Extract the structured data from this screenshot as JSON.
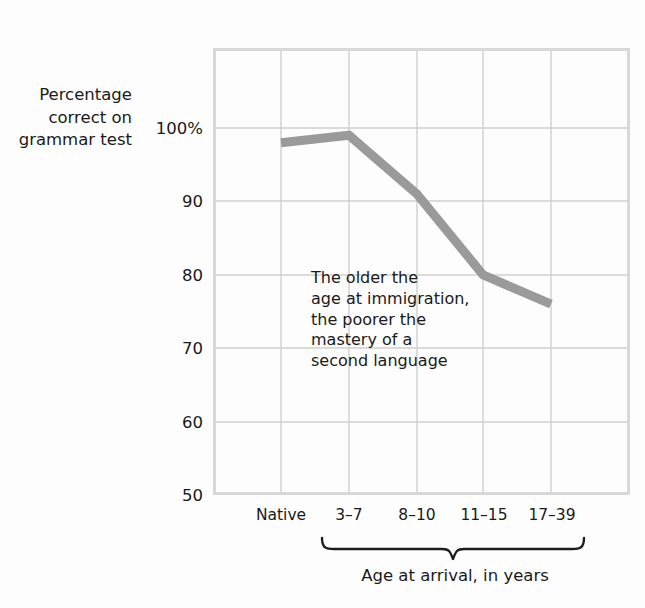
{
  "chart_data": {
    "type": "line",
    "title": "",
    "ylabel": "Percentage\ncorrect on\ngrammar test",
    "xlabel": "Age at arrival, in years",
    "categories": [
      "Native",
      "3–7",
      "8–10",
      "11–15",
      "17–39"
    ],
    "values": [
      98,
      99,
      91,
      80,
      76
    ],
    "series": [
      {
        "name": "Percentage correct on grammar test",
        "values": [
          98,
          99,
          91,
          80,
          76
        ],
        "color": "#9a9a9a"
      }
    ],
    "ylim": [
      50,
      100
    ],
    "yticks": [
      100,
      90,
      80,
      70,
      60,
      50
    ],
    "ytick_labels": [
      "100%",
      "90",
      "80",
      "70",
      "60",
      "50"
    ],
    "grid": true,
    "legend": false,
    "annotations": [
      {
        "text": "The older the\nage at immigration,\nthe poorer the\nmastery of a\nsecond language"
      }
    ],
    "brace": {
      "label": "Age at arrival, in years",
      "spans_categories": [
        "3–7",
        "17–39"
      ]
    }
  },
  "colors": {
    "background": "#fdfdfd",
    "line": "#9a9a9a",
    "grid": "#cfcfcf",
    "frame": "#d5d5d5",
    "text": "#1a1a1a",
    "brace": "#1d1d1d"
  }
}
